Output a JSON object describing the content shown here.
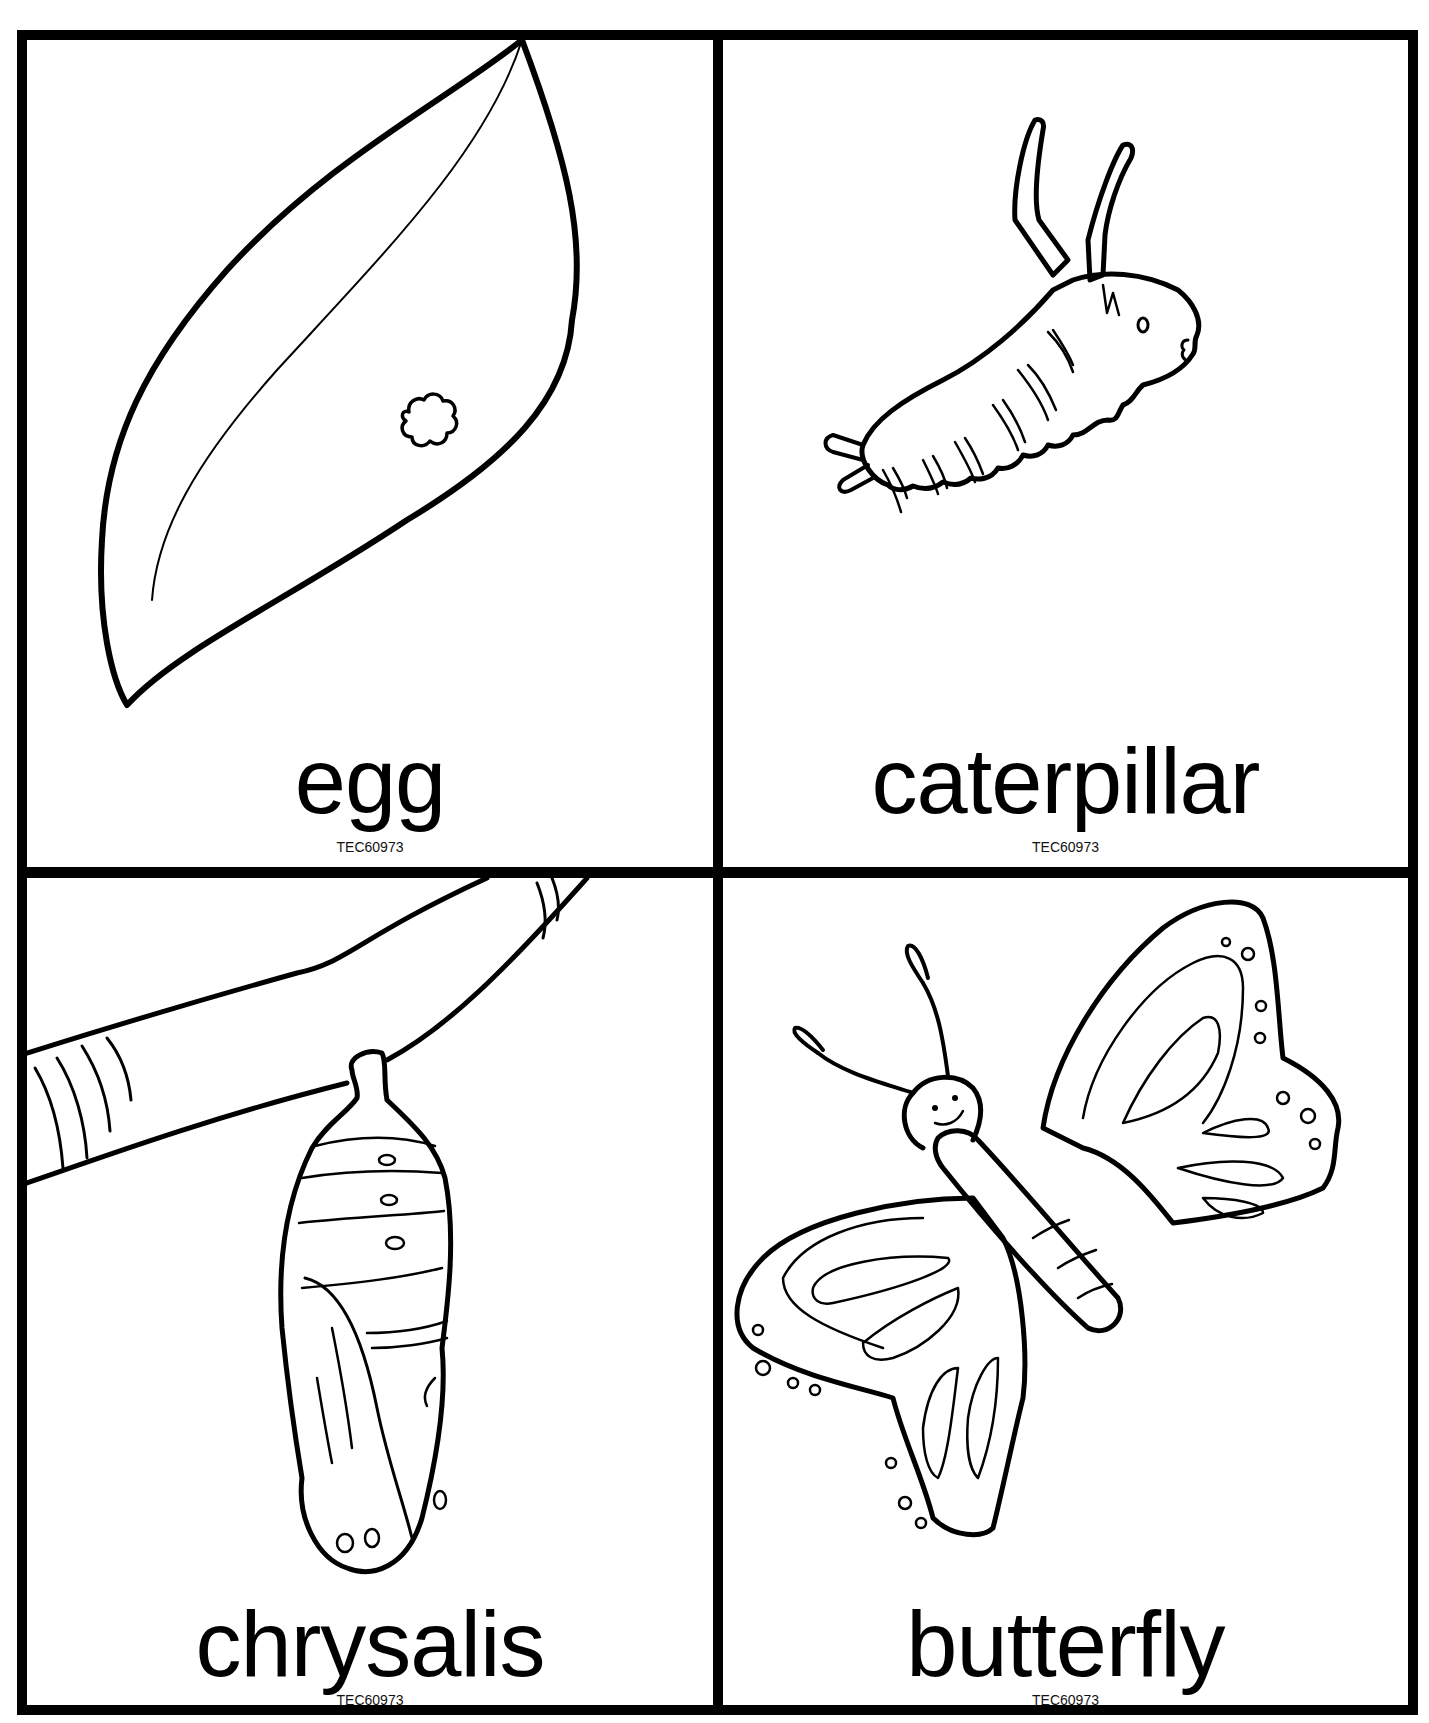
{
  "page": {
    "type": "butterfly life cycle picture cards",
    "top_fragment": "",
    "colors": {
      "line": "#000000",
      "background": "#ffffff"
    }
  },
  "cards": [
    {
      "id": "egg",
      "label": "egg",
      "code": "TEC60973",
      "illustration": "leaf-with-egg"
    },
    {
      "id": "caterpillar",
      "label": "caterpillar",
      "code": "TEC60973",
      "illustration": "caterpillar"
    },
    {
      "id": "chrysalis",
      "label": "chrysalis",
      "code": "TEC60973",
      "illustration": "chrysalis-on-branch"
    },
    {
      "id": "butterfly",
      "label": "butterfly",
      "code": "TEC60973",
      "illustration": "butterfly"
    }
  ]
}
